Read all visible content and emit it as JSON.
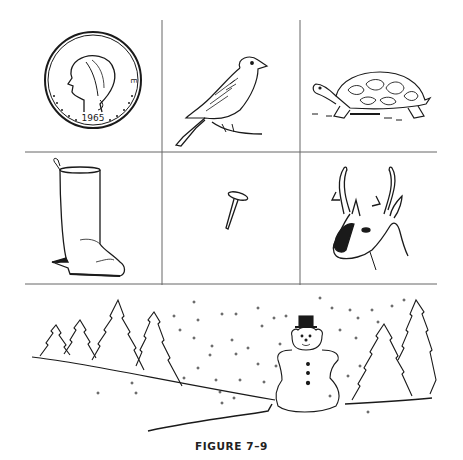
{
  "figure": {
    "caption": "FIGURE 7–9",
    "line_color": "#555555",
    "ink_color": "#1a1a1a"
  },
  "grid": {
    "rows": [
      {
        "cells": [
          {
            "subject": "coin",
            "icon": "coin-icon",
            "legend": "E PLURIBUS UNUM",
            "year": "1965"
          },
          {
            "subject": "bird",
            "icon": "bird-icon"
          },
          {
            "subject": "turtle",
            "icon": "turtle-icon"
          }
        ]
      },
      {
        "cells": [
          {
            "subject": "boot",
            "icon": "boot-icon"
          },
          {
            "subject": "tack",
            "icon": "tack-icon"
          },
          {
            "subject": "antelope",
            "icon": "antelope-icon"
          }
        ]
      }
    ]
  },
  "scene": {
    "subject": "winter-landscape",
    "elements": [
      "pine-trees-left",
      "snowman",
      "pine-trees-right",
      "falling-snow"
    ]
  }
}
